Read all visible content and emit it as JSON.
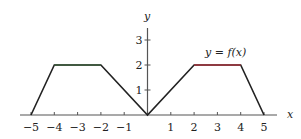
{
  "chart_data": {
    "type": "line",
    "title": "",
    "curve_label": "y = f(x)",
    "xlabel": "x",
    "ylabel": "y",
    "xlim": [
      -5.5,
      5.5
    ],
    "ylim": [
      0,
      3.5
    ],
    "x_ticks": [
      -5,
      -4,
      -3,
      -2,
      -1,
      1,
      2,
      3,
      4,
      5
    ],
    "x_tick_labels": [
      "−5",
      "−4",
      "−3",
      "−2",
      "−1",
      "1",
      "2",
      "3",
      "4",
      "5"
    ],
    "y_ticks": [
      1,
      2,
      3
    ],
    "y_tick_labels": [
      "1",
      "2",
      "3"
    ],
    "grid": false,
    "series": [
      {
        "name": "f(x)",
        "x": [
          -5,
          -4,
          -2,
          0,
          2,
          4,
          5
        ],
        "y": [
          0,
          2,
          2,
          0,
          2,
          2,
          0
        ]
      }
    ],
    "colors": {
      "axis": "#555555",
      "curve": "#222222",
      "highlight": "#a0303a"
    }
  }
}
